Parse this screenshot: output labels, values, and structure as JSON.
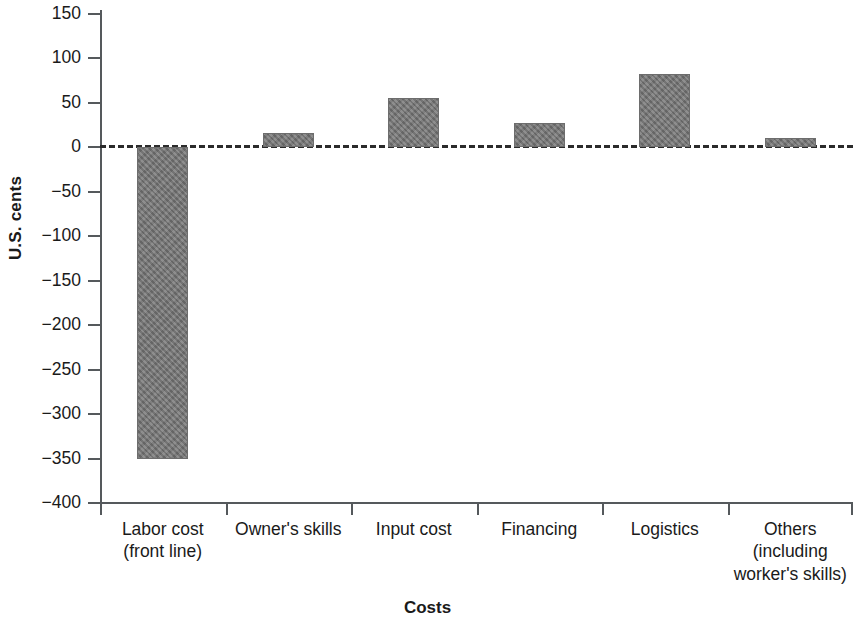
{
  "chart_data": {
    "type": "bar",
    "title": "",
    "xlabel": "Costs",
    "ylabel": "U.S. cents",
    "categories": [
      "Labor cost (front line)",
      "Owner's skills",
      "Input cost",
      "Financing",
      "Logistics",
      "Others (including worker's skills)"
    ],
    "category_lines": [
      [
        "Labor cost",
        "(front line)"
      ],
      [
        "Owner's skills"
      ],
      [
        "Input cost"
      ],
      [
        "Financing"
      ],
      [
        "Logistics"
      ],
      [
        "Others",
        "(including",
        "worker's skills)"
      ]
    ],
    "values": [
      -350,
      16,
      56,
      27,
      83,
      11
    ],
    "ylim": [
      -400,
      150
    ],
    "ytick_labels": [
      "150",
      "100",
      "50",
      "0",
      "−50",
      "−100",
      "−150",
      "−200",
      "−250",
      "−300",
      "−350",
      "−400"
    ],
    "ytick_values": [
      150,
      100,
      50,
      0,
      -50,
      -100,
      -150,
      -200,
      -250,
      -300,
      -350,
      -400
    ],
    "grid": false,
    "legend": null,
    "zero_reference_line": true,
    "zero_reference_style": "dashed",
    "bar_color": "#787878",
    "axis_color": "#55595c"
  }
}
